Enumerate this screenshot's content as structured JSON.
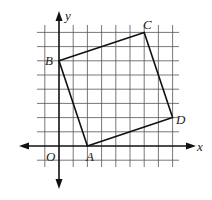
{
  "figure": {
    "type": "coordinate-grid-diagram",
    "axes": {
      "x_label": "x",
      "y_label": "y",
      "origin_label": "O"
    },
    "grid": {
      "x_min": -1,
      "x_max": 8,
      "y_min": -1,
      "y_max": 8
    },
    "points": [
      {
        "label": "A",
        "x": 2,
        "y": 0
      },
      {
        "label": "B",
        "x": 0,
        "y": 6
      },
      {
        "label": "C",
        "x": 6,
        "y": 8
      },
      {
        "label": "D",
        "x": 8,
        "y": 2
      }
    ],
    "polygon": [
      "A",
      "B",
      "C",
      "D"
    ],
    "colors": {
      "line": "#111111",
      "grid": "#555555",
      "background": "#ffffff"
    }
  }
}
